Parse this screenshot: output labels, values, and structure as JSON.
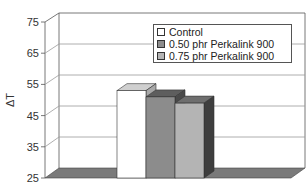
{
  "chart_data": {
    "type": "bar",
    "style": "3d-clustered-column",
    "title": "",
    "xlabel": "",
    "ylabel": "ΔT",
    "ylim": [
      25,
      75
    ],
    "yticks": [
      25,
      35,
      45,
      55,
      65,
      75
    ],
    "grid": true,
    "legend_position": "upper-right",
    "categories": [
      ""
    ],
    "series": [
      {
        "name": "Control",
        "values": [
          53
        ],
        "color": "#ffffff"
      },
      {
        "name": "0.50 phr Perkalink 900",
        "values": [
          51
        ],
        "color": "#8c8c8c"
      },
      {
        "name": "0.75 phr Perkalink 900",
        "values": [
          49
        ],
        "color": "#b4b4b4"
      }
    ]
  },
  "axis": {
    "y_title": "ΔT",
    "ticks": [
      "75",
      "65",
      "55",
      "45",
      "35",
      "25"
    ]
  },
  "legend": {
    "items": [
      {
        "label": "Control"
      },
      {
        "label": "0.50 phr Perkalink 900"
      },
      {
        "label": "0.75 phr Perkalink 900"
      }
    ]
  },
  "colors": {
    "floor": "#7a7a7a",
    "grid": "#9a9a9a",
    "axis": "#555555",
    "bar1_front": "#ffffff",
    "bar1_top": "#cfcfcf",
    "bar1_side": "#a8a8a8",
    "bar2_front": "#8c8c8c",
    "bar2_top": "#5e5e5e",
    "bar2_side": "#4a4a4a",
    "bar3_front": "#b4b4b4",
    "bar3_top": "#6e6e6e",
    "bar3_side": "#3e3e3e"
  }
}
